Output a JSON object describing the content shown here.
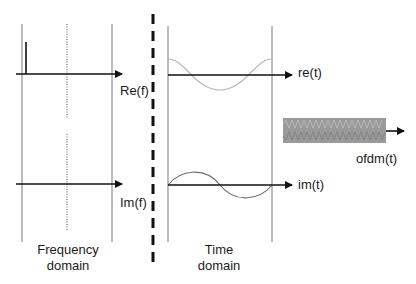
{
  "diagram": {
    "frequency_panel": {
      "caption_line1": "Frequency",
      "caption_line2": "domain",
      "re_axis_label": "Re(f)",
      "im_axis_label": "Im(f)"
    },
    "time_panel": {
      "caption_line1": "Time",
      "caption_line2": "domain",
      "re_axis_label": "re(t)",
      "im_axis_label": "im(t)"
    },
    "output": {
      "label": "ofdm(t)"
    },
    "colors": {
      "axis": "#111111",
      "panel_border": "#7a7a7a",
      "re_wave": "#b8b8b8",
      "im_wave": "#6e6e6e",
      "ofdm_block": "#8f8f8f",
      "divider": "#111111"
    }
  }
}
